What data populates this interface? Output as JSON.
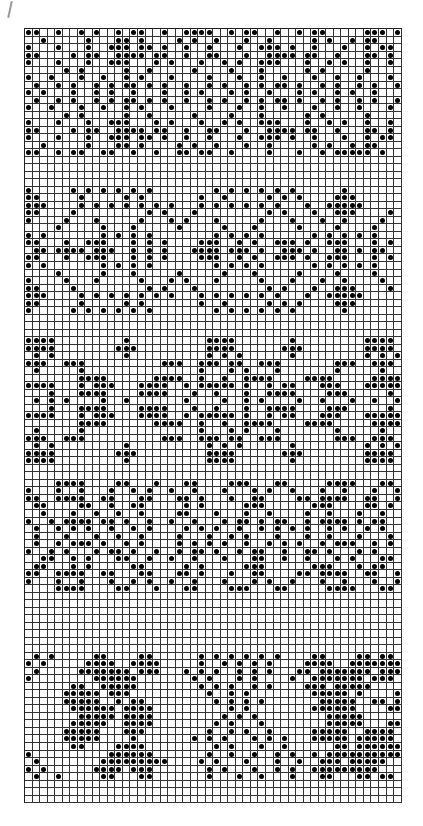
{
  "chart": {
    "type": "knitting-chart",
    "columns": 50,
    "rows": 103,
    "cell_size_px": 7.54,
    "colors": {
      "line": "#333333",
      "stitch": "#000000",
      "background": "#ffffff"
    },
    "legend": {
      "filled": "#",
      "empty": "."
    },
    "pattern": [
      "##..#..#.#..#.##..#..####..#.##..#..#.##.....###.#",
      "..#.....#...##.#....#.#..#...#..#.....#.#..#.##...",
      "#...#...#..###.##.#..#..#...#..###.#..#...#..#.##.",
      "##....#.##..####.##..#..##...#..####.##..#...##.#.",
      "#...#...#..###...#.#...#..#.#..###...#..#.#..#..#.",
      ".....#.#.....#..#.....#....#...#.....#.#.....#....",
      "#..#...#..#..#.#...#....#...#..#..#...#..#..#...#.",
      ".#..#.#..#.#.##.#.#..#..#.#..#.#.##.#..#.#..#.#..#",
      "#.#...#..#.#..#...#..#.#...#.#..#...#.#..#.#..#...",
      ".#..#.#..#.#.##.#.#..#..#.#..#.#.##.#..#.#..#.#..#",
      "#..#...#..#..#.#...#....#...#..#..#...#..#..#...#.",
      ".....#.#.....#..#.....#....#...#.....#.#.....#....",
      "#...#...#..###...#.#...#..#.#..###...#..#.#..#..#.",
      "##....#.##..####.##..#..##...#..####.##..#...##.#.",
      "#...#...#..###.##.#..#..#...#..###.#..#...#..#.##.",
      "..#.....#...##.#....#.#..#...#..#.....#.#..#.##...",
      "##..#.##..##..#..#..##.##..#....#...#..#.#####.#..",
      "..................................................",
      "..................................................",
      "..................................................",
      "..................................................",
      "#.....#.#.#.#.#.#........#.#.#.#.#.#......#......",
      "##.....#.....#.#.......#..#.....#.#.#....###.....",
      "###....#.#.#.#.#.#.#...#.#.#.#.#.#...#..#####....",
      "##....#.........#.#...#.........#.#...#..###....#",
      "#....#...#.....#...#.#...#.....#...#...#..#....#.",
      "....#.....#...#.....#.....#...#.....#....#....#..",
      "#.#.......#.#.#.#........#.#.#.#......#.#.#.#.#..",
      "##...#..###...#.#.#....###..#.#..###.#..###...#.#",
      ".##.####.###..#.#.#...####.###.#..###.#..##.#.##.",
      "##...#..###...#.#.#....###..#.#..###.#..###...#.#",
      "#.#.......#.#.#.#........#.#.#.#......#.#.#.#.#..",
      "....#.....#...#.....#.....#...#.....#....#....#..",
      "#....#...#.....#...#.#...#.....#...#...#..#....#.",
      "##....#.........#.#...#.........#.#...#..###....#",
      "###....#.#.#.#.#.#.#...#.#.#.#.#.#...#..#####....",
      "##.....#.....#.#.......#..#.....#.#.#....###.....",
      "#.....#.#.#.#.#.#........#.#.#.#.#.#......#......",
      "..................................................",
      "..................................................",
      "..................................................",
      "####.........#..........####.......#.........####.",
      "####........###.........####......###........####.",
      ".#.#.........#..........#.#.#......#.........#.#.#",
      "###..###..........###..###.##..###.......###..###.",
      ".#.....#...............#...#.#...#.......#.....#..",
      ".......####......####..#..#..####....####.....####",
      "####...#.###...####..#.#####.#..#.##...###...#####",
      "...#...####....####...#..#...#..####....###.....#.",
      ".#.#.#....#..#.......#....#..#.#....#..#...#..#..#",
      "...#...####....####...#..#...#..####....###.....#.",
      "####...#.###...####..#.#####.#..#.##...###...#####",
      ".......####......####..#..#..####....####.....####",
      ".#.....#...............#...#.#...#.......#.....#..",
      "###..###..........###..###.##..###.......###..###.",
      ".#.#.........#..........#.#.#......#.........#.#.#",
      "####........###.........####......###........####.",
      "####.........#..........####.......#.........####.",
      "..................................................",
      "..................................................",
      "....####....##...#...##....###...##.....####...##.",
      "#...#..#...#..#.#..#..#...#...#.#..#...#..#...#..#",
      "##..####..##...##...##.#...#..##....##.####..##..#",
      ".##....##..#..##.....#.#.....###......###....##.#.",
      "..#...#..#..#..#....##...#...#..#....#..#...#..#.",
      "#..#.####.##.#..#..#..#...#.##.#.##..#.####.#.##.",
      ".#..#.#.#..#..#.#....#.#.#..#..#.#.#.#..#.#..#.#.",
      ".#...#...#..#..#....#...#..#.#...#...#..#...#...#",
      ".#..#.###.#..#.#....#.#.#.#..#..#.#.#..#.###..#.#",
      "#..#.#...#.##.#..#..#.##.#..#.##..#..##.#...#.#..",
      "..##..#.#...##..#..#..#...#...##..#..#...#.#...##",
      ".##...#.#.....##.....#.#.....###......###...#.##.",
      "##..####..##...##...##.#...#..##....##.####..##..#",
      "#...#..#...#..#.#..#..#...#...#.#..#...#..#...#..#",
      "....####....##...#...##....###...##.....####...##.",
      "..................................................",
      "..................................................",
      "..................................................",
      "..................................................",
      "..................................................",
      "..................................................",
      "..................................................",
      "..................................................",
      ".#.#.....##....##......#.#.#.#.#.#....##....##.##",
      "#.#.....####..####.....#..#.#.#.#....####..#######",
      ".#.....#######.###...#.#.#..#.#.#...##.#######.###",
      "#........######.......#.#...#.#....#..#######.###.",
      "......##..#####........#.#.#..#.#....###.#####....",
      ".....#####.###..........#..#.#........#####.#....#",
      ".....#####..#.##.........#.#.#.#.......#####..##.#",
      "......######.####..........#.#........######....##",
      ".......#####.####.........#.#.#.........#####.....",
      "......#####..####........#.#...#........#####...##",
      ".....#####...###........#..#.#..#.....#####..####",
      ".....#####....#.......#.#.#...#.#.#...#####.#####.",
      "......##....####.........#.#...#..#......##.######",
      "#..........######.......#..#..#..#.#..#.##########",
      ".#........#########....#.#...#...#..#..###.#####.",
      "#.#......####.###.......#.#...#..#.#..#########..",
      ".#..#.....##...##.......#...#..#...#...##...##.##"
    ]
  }
}
